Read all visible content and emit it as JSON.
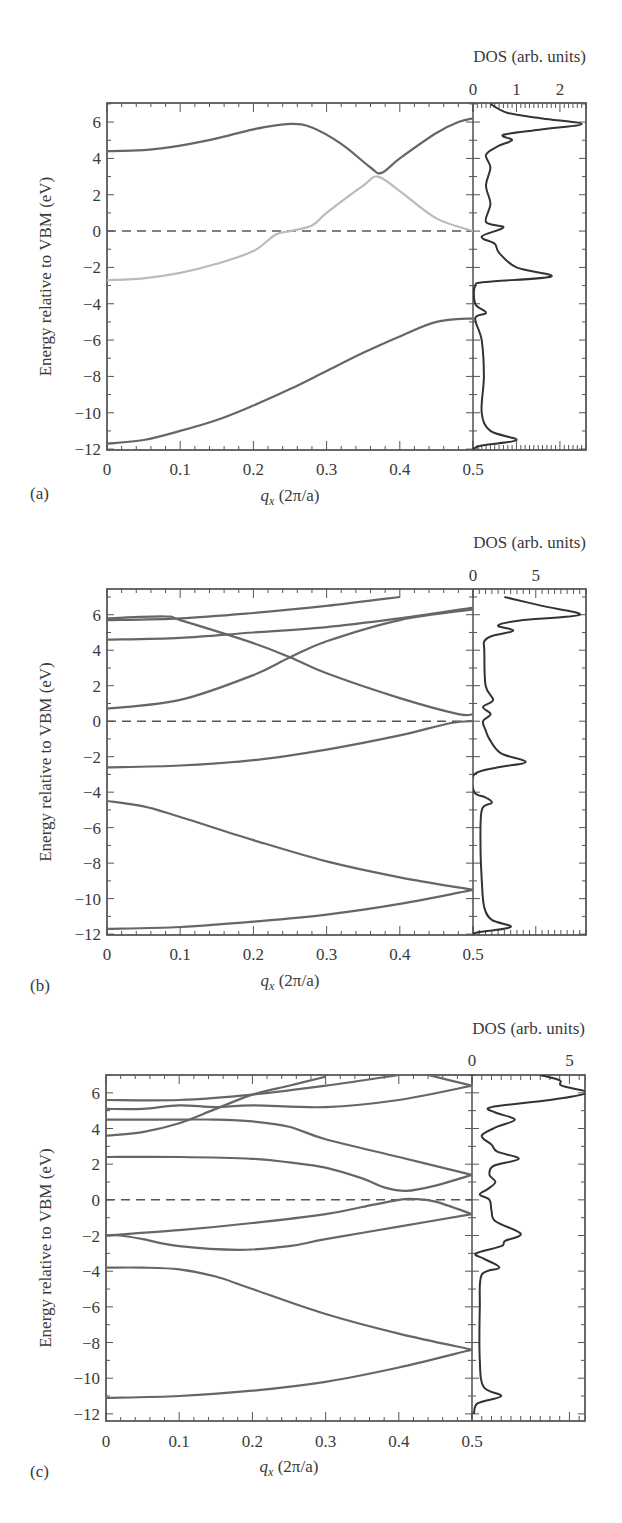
{
  "figure": {
    "ylabel": "Energy relative to VBM (eV)",
    "xlabel_main": "q",
    "xlabel_sub": "x",
    "xlabel_unit": " (2π/a)",
    "dos_label": "DOS (arb. units)"
  },
  "panels": [
    {
      "label": "(a)",
      "dos_ticks": [
        "0",
        "1",
        "2"
      ]
    },
    {
      "label": "(b)",
      "dos_ticks": [
        "0",
        "5"
      ]
    },
    {
      "label": "(c)",
      "dos_ticks": [
        "0",
        "5"
      ]
    }
  ],
  "chart_data": [
    {
      "type": "line",
      "title": "(a)",
      "xlabel": "q_x (2π/a)",
      "ylabel": "Energy relative to VBM (eV)",
      "xlim": [
        0,
        0.5
      ],
      "ylim": [
        -12,
        7
      ],
      "xticks": [
        0,
        0.1,
        0.2,
        0.3,
        0.4,
        0.5
      ],
      "yticks": [
        6,
        4,
        2,
        0,
        -2,
        -4,
        -6,
        -8,
        -10,
        -12
      ],
      "reference_line": {
        "y": 0,
        "style": "dashed"
      },
      "series": [
        {
          "name": "band-1",
          "color": "#666666",
          "x": [
            0,
            0.05,
            0.1,
            0.15,
            0.2,
            0.25,
            0.3,
            0.35,
            0.4,
            0.45,
            0.5
          ],
          "y": [
            -11.7,
            -11.5,
            -11.0,
            -10.4,
            -9.6,
            -8.7,
            -7.7,
            -6.7,
            -5.8,
            -5.0,
            -4.8
          ]
        },
        {
          "name": "band-2",
          "color": "#bbbbbb",
          "x": [
            0,
            0.05,
            0.1,
            0.15,
            0.2,
            0.23,
            0.25,
            0.28,
            0.3,
            0.35,
            0.37,
            0.4,
            0.45,
            0.5
          ],
          "y": [
            -2.7,
            -2.6,
            -2.3,
            -1.8,
            -1.1,
            -0.2,
            0.0,
            0.3,
            1.0,
            2.5,
            3.0,
            2.2,
            0.7,
            0.0
          ]
        },
        {
          "name": "band-3",
          "color": "#666666",
          "x": [
            0,
            0.05,
            0.1,
            0.15,
            0.2,
            0.25,
            0.28,
            0.32,
            0.36,
            0.375,
            0.4,
            0.45,
            0.48,
            0.5
          ],
          "y": [
            4.4,
            4.45,
            4.7,
            5.1,
            5.6,
            5.9,
            5.7,
            4.8,
            3.5,
            3.2,
            4.0,
            5.4,
            6.0,
            6.2
          ]
        }
      ],
      "dos": {
        "xlim": [
          0,
          2.6
        ],
        "xticks": [
          0,
          1,
          2
        ],
        "E": [
          7,
          6.5,
          6.2,
          5.9,
          5.6,
          5.3,
          5.0,
          4.7,
          4.2,
          3.5,
          2.5,
          1.5,
          0.5,
          0.2,
          -0.3,
          -0.7,
          -1.2,
          -2.0,
          -2.5,
          -2.8,
          -3.0,
          -4.0,
          -4.5,
          -4.8,
          -6,
          -8,
          -10,
          -11,
          -11.5,
          -11.8,
          -12
        ],
        "D": [
          0.4,
          0.8,
          1.6,
          2.5,
          1.6,
          0.7,
          0.9,
          0.6,
          0.3,
          0.4,
          0.3,
          0.4,
          0.3,
          0.7,
          0.2,
          0.5,
          0.6,
          1.0,
          1.8,
          0.3,
          0.05,
          0.05,
          0.3,
          0.05,
          0.2,
          0.25,
          0.2,
          0.4,
          1.0,
          0.2,
          0.0
        ]
      }
    },
    {
      "type": "line",
      "title": "(b)",
      "xlabel": "q_x (2π/a)",
      "ylabel": "Energy relative to VBM (eV)",
      "xlim": [
        0,
        0.5
      ],
      "ylim": [
        -12,
        7
      ],
      "xticks": [
        0,
        0.1,
        0.2,
        0.3,
        0.4,
        0.5
      ],
      "yticks": [
        6,
        4,
        2,
        0,
        -2,
        -4,
        -6,
        -8,
        -10,
        -12
      ],
      "reference_line": {
        "y": 0,
        "style": "dashed"
      },
      "series": [
        {
          "name": "band-1",
          "color": "#666666",
          "x": [
            0,
            0.1,
            0.2,
            0.3,
            0.4,
            0.5
          ],
          "y": [
            -11.7,
            -11.6,
            -11.3,
            -10.9,
            -10.3,
            -9.5
          ]
        },
        {
          "name": "band-2",
          "color": "#666666",
          "x": [
            0,
            0.05,
            0.1,
            0.2,
            0.3,
            0.4,
            0.5
          ],
          "y": [
            -4.5,
            -4.8,
            -5.4,
            -6.7,
            -7.9,
            -8.8,
            -9.5
          ]
        },
        {
          "name": "band-3",
          "color": "#666666",
          "x": [
            0,
            0.1,
            0.2,
            0.3,
            0.4,
            0.47,
            0.5
          ],
          "y": [
            -2.6,
            -2.5,
            -2.2,
            -1.6,
            -0.8,
            -0.1,
            0.0
          ]
        },
        {
          "name": "band-4",
          "color": "#666666",
          "x": [
            0,
            0.1,
            0.2,
            0.25,
            0.3,
            0.4,
            0.5
          ],
          "y": [
            0.7,
            1.2,
            2.6,
            3.6,
            4.5,
            5.7,
            6.3
          ]
        },
        {
          "name": "band-5",
          "color": "#666666",
          "x": [
            0,
            0.08,
            0.1,
            0.2,
            0.25,
            0.3,
            0.4,
            0.48,
            0.5
          ],
          "y": [
            5.8,
            5.9,
            5.7,
            4.4,
            3.6,
            2.7,
            1.3,
            0.4,
            0.4
          ]
        },
        {
          "name": "band-6",
          "color": "#666666",
          "x": [
            0,
            0.1,
            0.2,
            0.3,
            0.4,
            0.5
          ],
          "y": [
            4.6,
            4.7,
            5.0,
            5.3,
            5.8,
            6.4
          ]
        },
        {
          "name": "band-7",
          "color": "#666666",
          "x": [
            0,
            0.1,
            0.2,
            0.3,
            0.4
          ],
          "y": [
            5.7,
            5.8,
            6.1,
            6.5,
            7.0
          ]
        }
      ],
      "dos": {
        "xlim": [
          0,
          9
        ],
        "xticks": [
          0,
          5
        ],
        "E": [
          7,
          6.5,
          6.0,
          5.7,
          5.4,
          5.1,
          4.8,
          4.5,
          4.0,
          2.0,
          1.2,
          0.8,
          0.4,
          0.0,
          -0.5,
          -1.0,
          -1.8,
          -2.3,
          -2.6,
          -3.0,
          -4.0,
          -4.3,
          -4.6,
          -5.0,
          -7,
          -9,
          -10.5,
          -11.2,
          -11.6,
          -11.9,
          -12
        ],
        "D": [
          2.5,
          5.5,
          8.5,
          4.0,
          2.0,
          3.2,
          1.5,
          0.9,
          0.9,
          1.0,
          1.6,
          0.8,
          1.4,
          0.8,
          1.0,
          1.3,
          2.2,
          4.2,
          2.0,
          0.1,
          0.1,
          1.0,
          1.5,
          0.7,
          0.6,
          0.7,
          0.9,
          1.5,
          3.0,
          0.4,
          0.0
        ]
      }
    },
    {
      "type": "line",
      "title": "(c)",
      "xlabel": "q_x (2π/a)",
      "ylabel": "Energy relative to VBM (eV)",
      "xlim": [
        0,
        0.5
      ],
      "ylim": [
        -12,
        7
      ],
      "xticks": [
        0,
        0.1,
        0.2,
        0.3,
        0.4,
        0.5
      ],
      "yticks": [
        6,
        4,
        2,
        0,
        -2,
        -4,
        -6,
        -8,
        -10,
        -12
      ],
      "reference_line": {
        "y": 0,
        "style": "dashed"
      },
      "series": [
        {
          "name": "band-1",
          "color": "#666666",
          "x": [
            0,
            0.1,
            0.2,
            0.3,
            0.4,
            0.5
          ],
          "y": [
            -11.1,
            -11.0,
            -10.7,
            -10.2,
            -9.4,
            -8.4
          ]
        },
        {
          "name": "band-2",
          "color": "#666666",
          "x": [
            0,
            0.05,
            0.1,
            0.15,
            0.2,
            0.3,
            0.4,
            0.5
          ],
          "y": [
            -3.8,
            -3.8,
            -3.9,
            -4.3,
            -5.0,
            -6.4,
            -7.5,
            -8.4
          ]
        },
        {
          "name": "band-3",
          "color": "#666666",
          "x": [
            0,
            0.02,
            0.05,
            0.1,
            0.18,
            0.25,
            0.3,
            0.4,
            0.5
          ],
          "y": [
            -2.0,
            -2.0,
            -2.2,
            -2.6,
            -2.8,
            -2.6,
            -2.2,
            -1.5,
            -0.8
          ]
        },
        {
          "name": "band-4",
          "color": "#666666",
          "x": [
            0,
            0.1,
            0.2,
            0.3,
            0.35,
            0.4,
            0.42,
            0.45,
            0.5
          ],
          "y": [
            -2.0,
            -1.7,
            -1.3,
            -0.8,
            -0.4,
            0.0,
            0.05,
            -0.1,
            -0.8
          ]
        },
        {
          "name": "band-5",
          "color": "#666666",
          "x": [
            0,
            0.1,
            0.2,
            0.25,
            0.3,
            0.35,
            0.38,
            0.41,
            0.45,
            0.5
          ],
          "y": [
            2.4,
            2.4,
            2.3,
            2.1,
            1.8,
            1.2,
            0.7,
            0.5,
            0.8,
            1.4
          ]
        },
        {
          "name": "band-6",
          "color": "#666666",
          "x": [
            0,
            0.1,
            0.15,
            0.2,
            0.25,
            0.3,
            0.4,
            0.5
          ],
          "y": [
            4.5,
            4.5,
            4.5,
            4.4,
            4.1,
            3.4,
            2.4,
            1.4
          ]
        },
        {
          "name": "band-7",
          "color": "#666666",
          "x": [
            0,
            0.05,
            0.1,
            0.15,
            0.2,
            0.25,
            0.3
          ],
          "y": [
            3.6,
            3.8,
            4.3,
            5.1,
            5.9,
            6.4,
            6.9
          ]
        },
        {
          "name": "band-8",
          "color": "#666666",
          "x": [
            0,
            0.05,
            0.1,
            0.15,
            0.2,
            0.3,
            0.4,
            0.5
          ],
          "y": [
            5.1,
            5.1,
            5.3,
            5.2,
            5.3,
            5.2,
            5.6,
            6.4
          ]
        },
        {
          "name": "band-9",
          "color": "#666666",
          "x": [
            0,
            0.1,
            0.2,
            0.3,
            0.4
          ],
          "y": [
            5.6,
            5.6,
            5.9,
            6.4,
            7.0
          ]
        },
        {
          "name": "band-10",
          "color": "#666666",
          "x": [
            0.44,
            0.5
          ],
          "y": [
            7.0,
            6.4
          ]
        }
      ],
      "dos": {
        "xlim": [
          0,
          5.8
        ],
        "xticks": [
          0,
          5
        ],
        "E": [
          7,
          6.7,
          6.4,
          6.0,
          5.6,
          5.2,
          4.9,
          4.5,
          4.1,
          3.6,
          3.1,
          2.7,
          2.3,
          1.9,
          1.4,
          1.0,
          0.6,
          0.3,
          0.0,
          -0.6,
          -1.2,
          -1.9,
          -2.3,
          -2.6,
          -3.0,
          -3.3,
          -3.8,
          -4.2,
          -6,
          -9,
          -10.5,
          -11.0,
          -11.4,
          -12
        ],
        "D": [
          3.5,
          4.5,
          4.6,
          5.9,
          4.0,
          1.0,
          1.2,
          2.2,
          1.3,
          0.5,
          1.0,
          1.3,
          2.4,
          1.1,
          0.9,
          1.2,
          0.8,
          0.4,
          0.9,
          1.0,
          1.2,
          2.5,
          1.7,
          1.5,
          0.2,
          0.6,
          1.4,
          0.5,
          0.4,
          0.4,
          0.6,
          1.5,
          0.3,
          0.1
        ]
      }
    }
  ]
}
